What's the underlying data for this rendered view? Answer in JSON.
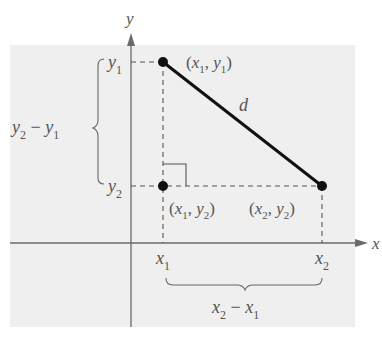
{
  "diagram": {
    "axes": {
      "x_label": "x",
      "y_label": "y"
    },
    "points": [
      {
        "id": "p1",
        "label_x": "x",
        "sub_x": "1",
        "label_y": "y",
        "sub_y": "1"
      },
      {
        "id": "p3",
        "label_x": "x",
        "sub_x": "1",
        "label_y": "y",
        "sub_y": "2"
      },
      {
        "id": "p2",
        "label_x": "x",
        "sub_x": "2",
        "label_y": "y",
        "sub_y": "2"
      }
    ],
    "segment_label": "d",
    "ticks": {
      "x1": {
        "v": "x",
        "s": "1"
      },
      "x2": {
        "v": "x",
        "s": "2"
      },
      "y1": {
        "v": "y",
        "s": "1"
      },
      "y2": {
        "v": "y",
        "s": "2"
      }
    },
    "braces": {
      "vertical": {
        "a": "y",
        "as": "2",
        "op": " − ",
        "b": "y",
        "bs": "1"
      },
      "horizontal": {
        "a": "x",
        "as": "2",
        "op": " − ",
        "b": "x",
        "bs": "1"
      }
    },
    "colors": {
      "panel": "#efefef",
      "axis": "#6b6b6b",
      "segment": "#111111",
      "text": "#555555"
    }
  }
}
